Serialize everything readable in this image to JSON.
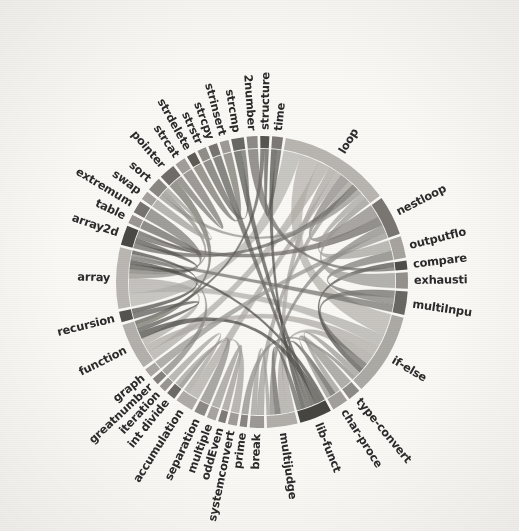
{
  "figure": {
    "title": "",
    "background_color": "#faf9f6",
    "ink_color": "#2b2b2b"
  },
  "chart_data": {
    "type": "chord",
    "title": "",
    "subtitle": "",
    "xlabel": "",
    "ylabel": "",
    "legend": [],
    "grid": false,
    "palette": "grayscale",
    "center": [
      262,
      282
    ],
    "outer_radius": 146,
    "ring_thickness": 12,
    "start_angle_deg": -86,
    "gap_deg": 1.1,
    "nodes": [
      {
        "label": "time",
        "value": 6,
        "color": "#7d7a76",
        "truncated": false
      },
      {
        "label": "loop",
        "value": 62,
        "color": "#b9b6b1",
        "truncated": false
      },
      {
        "label": "nestloop",
        "value": 22,
        "color": "#7a7773",
        "truncated": false
      },
      {
        "label": "outputflo",
        "value": 12,
        "color": "#a7a49f",
        "truncated": true
      },
      {
        "label": "compare",
        "value": 5,
        "color": "#4f4d4a",
        "truncated": false
      },
      {
        "label": "exhausti",
        "value": 9,
        "color": "#95928d",
        "truncated": true
      },
      {
        "label": "multiInpu",
        "value": 13,
        "color": "#6b6864",
        "truncated": true
      },
      {
        "label": "if-else",
        "value": 46,
        "color": "#adaaa5",
        "truncated": false
      },
      {
        "label": "type-convert",
        "value": 7,
        "color": "#8f8c88",
        "truncated": false
      },
      {
        "label": "char-proce",
        "value": 9,
        "color": "#a3a09b",
        "truncated": true
      },
      {
        "label": "lib-funct",
        "value": 18,
        "color": "#46443f",
        "truncated": true
      },
      {
        "label": "multijudge",
        "value": 17,
        "color": "#b2afaa",
        "truncated": false
      },
      {
        "label": "break",
        "value": 8,
        "color": "#9d9a95",
        "truncated": false
      },
      {
        "label": "prime",
        "value": 4,
        "color": "#8a8782",
        "truncated": false
      },
      {
        "label": "systemconvert",
        "value": 5,
        "color": "#a09d98",
        "truncated": false
      },
      {
        "label": "oddEven",
        "value": 4,
        "color": "#7f7c78",
        "truncated": false
      },
      {
        "label": "multiple",
        "value": 5,
        "color": "#a8a5a0",
        "truncated": false
      },
      {
        "label": "separation",
        "value": 6,
        "color": "#8d8a86",
        "truncated": false
      },
      {
        "label": "accumulation",
        "value": 10,
        "color": "#b0ada8",
        "truncated": false
      },
      {
        "label": "int divide",
        "value": 5,
        "color": "#6e6b67",
        "truncated": false
      },
      {
        "label": "iteration",
        "value": 4,
        "color": "#9a9792",
        "truncated": false
      },
      {
        "label": "greatnumber",
        "value": 4,
        "color": "#85827e",
        "truncated": false
      },
      {
        "label": "graph",
        "value": 5,
        "color": "#aaa7a2",
        "truncated": false
      },
      {
        "label": "function",
        "value": 26,
        "color": "#b4b1ac",
        "truncated": false
      },
      {
        "label": "recursion",
        "value": 6,
        "color": "#55534f",
        "truncated": false
      },
      {
        "label": "array",
        "value": 34,
        "color": "#bbb8b3",
        "truncated": false
      },
      {
        "label": "array2d",
        "value": 11,
        "color": "#4b4945",
        "truncated": false
      },
      {
        "label": "table",
        "value": 5,
        "color": "#9b9893",
        "truncated": false
      },
      {
        "label": "extremum",
        "value": 7,
        "color": "#767370",
        "truncated": false
      },
      {
        "label": "swap",
        "value": 5,
        "color": "#a5a29d",
        "truncated": false
      },
      {
        "label": "sort",
        "value": 8,
        "color": "#8b8884",
        "truncated": false
      },
      {
        "label": "pointer",
        "value": 9,
        "color": "#6f6c68",
        "truncated": false
      },
      {
        "label": "strcat",
        "value": 6,
        "color": "#a29f9a",
        "truncated": false
      },
      {
        "label": "strdelete",
        "value": 5,
        "color": "#5e5b57",
        "truncated": false
      },
      {
        "label": "strstr",
        "value": 5,
        "color": "#918e89",
        "truncated": false
      },
      {
        "label": "strcpy",
        "value": 5,
        "color": "#787571",
        "truncated": false
      },
      {
        "label": "strinsert",
        "value": 5,
        "color": "#9e9b96",
        "truncated": false
      },
      {
        "label": "strcmp",
        "value": 7,
        "color": "#6a6763",
        "truncated": false
      },
      {
        "label": "2number",
        "value": 6,
        "color": "#8e8b87",
        "truncated": false
      },
      {
        "label": "structure",
        "value": 5,
        "color": "#58564f",
        "truncated": false
      }
    ],
    "links": [
      {
        "source": "loop",
        "target": "array",
        "value": 16,
        "color": "#b6b3ae"
      },
      {
        "source": "loop",
        "target": "if-else",
        "value": 18,
        "color": "#b4b1ac"
      },
      {
        "source": "loop",
        "target": "function",
        "value": 11,
        "color": "#b0ada8"
      },
      {
        "source": "loop",
        "target": "multijudge",
        "value": 7,
        "color": "#a9a6a1"
      },
      {
        "source": "loop",
        "target": "accumulation",
        "value": 6,
        "color": "#aeaba6"
      },
      {
        "source": "loop",
        "target": "nestloop",
        "value": 9,
        "color": "#8a8783"
      },
      {
        "source": "loop",
        "target": "break",
        "value": 5,
        "color": "#9f9c97"
      },
      {
        "source": "loop",
        "target": "array2d",
        "value": 6,
        "color": "#6b6864"
      },
      {
        "source": "loop",
        "target": "sort",
        "value": 5,
        "color": "#96938e"
      },
      {
        "source": "loop",
        "target": "outputflo",
        "value": 6,
        "color": "#a5a29d"
      },
      {
        "source": "if-else",
        "target": "array",
        "value": 10,
        "color": "#b2afaa"
      },
      {
        "source": "if-else",
        "target": "function",
        "value": 9,
        "color": "#aeaba6"
      },
      {
        "source": "if-else",
        "target": "multijudge",
        "value": 8,
        "color": "#a8a5a0"
      },
      {
        "source": "if-else",
        "target": "multiInpu",
        "value": 5,
        "color": "#6e6b67"
      },
      {
        "source": "if-else",
        "target": "compare",
        "value": 4,
        "color": "#53514d"
      },
      {
        "source": "if-else",
        "target": "char-proce",
        "value": 5,
        "color": "#9d9a95"
      },
      {
        "source": "if-else",
        "target": "prime",
        "value": 3,
        "color": "#8f8c88"
      },
      {
        "source": "array",
        "target": "function",
        "value": 9,
        "color": "#b0ada8"
      },
      {
        "source": "array",
        "target": "sort",
        "value": 6,
        "color": "#94918c"
      },
      {
        "source": "array",
        "target": "extremum",
        "value": 5,
        "color": "#7d7a76"
      },
      {
        "source": "array",
        "target": "array2d",
        "value": 6,
        "color": "#57554f"
      },
      {
        "source": "array",
        "target": "lib-funct",
        "value": 5,
        "color": "#4e4c47"
      },
      {
        "source": "function",
        "target": "lib-funct",
        "value": 8,
        "color": "#4a4843"
      },
      {
        "source": "function",
        "target": "recursion",
        "value": 5,
        "color": "#5b5955"
      },
      {
        "source": "function",
        "target": "pointer",
        "value": 5,
        "color": "#757269"
      },
      {
        "source": "function",
        "target": "structure",
        "value": 4,
        "color": "#5d5b55"
      },
      {
        "source": "lib-funct",
        "target": "strcmp",
        "value": 5,
        "color": "#56544f"
      },
      {
        "source": "lib-funct",
        "target": "strcpy",
        "value": 4,
        "color": "#5f5d58"
      },
      {
        "source": "lib-funct",
        "target": "char-proce",
        "value": 5,
        "color": "#615f5a"
      },
      {
        "source": "lib-funct",
        "target": "time",
        "value": 4,
        "color": "#4f4d48"
      },
      {
        "source": "lib-funct",
        "target": "multijudge",
        "value": 6,
        "color": "#656360"
      },
      {
        "source": "nestloop",
        "target": "array2d",
        "value": 6,
        "color": "#6d6a66"
      },
      {
        "source": "nestloop",
        "target": "multijudge",
        "value": 5,
        "color": "#8b8884"
      },
      {
        "source": "nestloop",
        "target": "graph",
        "value": 4,
        "color": "#979490"
      },
      {
        "source": "multiInpu",
        "target": "outputflo",
        "value": 5,
        "color": "#7e7b77"
      },
      {
        "source": "multiInpu",
        "target": "array",
        "value": 5,
        "color": "#74716d"
      },
      {
        "source": "exhausti",
        "target": "loop",
        "value": 6,
        "color": "#9b9893"
      },
      {
        "source": "pointer",
        "target": "strcat",
        "value": 4,
        "color": "#7c7975"
      },
      {
        "source": "swap",
        "target": "sort",
        "value": 4,
        "color": "#a19e99"
      },
      {
        "source": "accumulation",
        "target": "iteration",
        "value": 3,
        "color": "#a5a29d"
      },
      {
        "source": "separation",
        "target": "int divide",
        "value": 3,
        "color": "#8e8b87"
      },
      {
        "source": "type-convert",
        "target": "char-proce",
        "value": 4,
        "color": "#96938f"
      },
      {
        "source": "time",
        "target": "structure",
        "value": 4,
        "color": "#5c5a54"
      },
      {
        "source": "2number",
        "target": "compare",
        "value": 3,
        "color": "#716e6a"
      },
      {
        "source": "greatnumber",
        "target": "array",
        "value": 3,
        "color": "#8a8783"
      },
      {
        "source": "table",
        "target": "array2d",
        "value": 3,
        "color": "#6a6763"
      },
      {
        "source": "strinsert",
        "target": "strdelete",
        "value": 3,
        "color": "#79766f"
      },
      {
        "source": "strstr",
        "target": "strcmp",
        "value": 3,
        "color": "#6c6965"
      },
      {
        "source": "oddEven",
        "target": "multiple",
        "value": 3,
        "color": "#9c9994"
      },
      {
        "source": "systemconvert",
        "target": "int divide",
        "value": 3,
        "color": "#a39f9a"
      },
      {
        "source": "recursion",
        "target": "array",
        "value": 4,
        "color": "#4f4d49"
      },
      {
        "source": "break",
        "target": "multijudge",
        "value": 4,
        "color": "#a09d98"
      }
    ]
  }
}
